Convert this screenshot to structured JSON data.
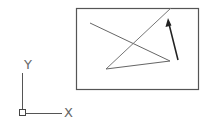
{
  "drawing": {
    "background": "#ffffff",
    "stroke_color": "#555555",
    "arrow_color": "#222222",
    "frame": {
      "x": 76,
      "y": 8,
      "width": 122,
      "height": 81
    },
    "lines": [
      {
        "id": "line-a",
        "x1": 90,
        "y1": 23,
        "x2": 170,
        "y2": 61
      },
      {
        "id": "line-b",
        "x1": 106,
        "y1": 69,
        "x2": 171,
        "y2": 8
      },
      {
        "id": "line-c",
        "x1": 106,
        "y1": 69,
        "x2": 170,
        "y2": 61
      }
    ],
    "arrow": {
      "x1": 178,
      "y1": 60,
      "x2": 168,
      "y2": 19
    }
  },
  "ucs_icon": {
    "x_label": "X",
    "y_label": "Y",
    "origin": {
      "x": 22,
      "y": 113
    },
    "x_axis_end": 62,
    "y_axis_top": 73
  }
}
